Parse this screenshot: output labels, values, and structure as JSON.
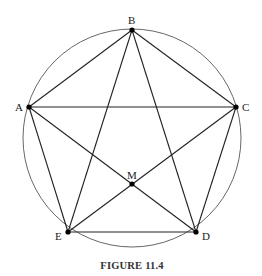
{
  "figure": {
    "caption": "FIGURE 11.4",
    "circle": {
      "cx": 132,
      "cy": 138,
      "r": 109
    },
    "points": {
      "A": {
        "x": 29,
        "y": 107,
        "label": "A"
      },
      "B": {
        "x": 132,
        "y": 30,
        "label": "B"
      },
      "C": {
        "x": 236,
        "y": 107,
        "label": "C"
      },
      "D": {
        "x": 196,
        "y": 232,
        "label": "D"
      },
      "E": {
        "x": 68,
        "y": 232,
        "label": "E"
      },
      "M": {
        "x": 132,
        "y": 184,
        "label": "M"
      }
    },
    "segments": [
      "AB",
      "BC",
      "CD",
      "DE",
      "EA",
      "AC",
      "BD",
      "BE",
      "AD",
      "CE"
    ],
    "colors": {
      "line": "#222222",
      "circle": "#555555",
      "point": "#000000"
    }
  }
}
